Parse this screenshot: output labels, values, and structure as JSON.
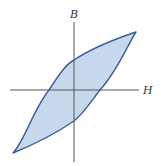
{
  "diagram": {
    "type": "hysteresis-loop",
    "x_axis_label": "H",
    "y_axis_label": "B",
    "colors": {
      "loop_stroke": "#3a5ca0",
      "loop_fill": "#c8d8ec",
      "axis": "#555555",
      "label": "#333333"
    }
  }
}
